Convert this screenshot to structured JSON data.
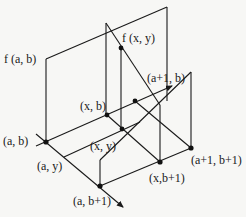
{
  "diagram": {
    "labels": {
      "f_ab": "f (a, b)",
      "f_xy": "f (x, y)",
      "a1_b": "(a+1, b)",
      "x_b": "(x, b)",
      "a_b": "(a, b)",
      "x_y": "(x, y)",
      "a_y": "(a, y)",
      "a1_b1": "(a+1, b+1)",
      "x_b1": "(x,b+1)",
      "a_b1": "(a, b+1)"
    },
    "points": [
      {
        "name": "(a, b)",
        "x": 46,
        "y": 142
      },
      {
        "name": "(x, b)",
        "x": 107,
        "y": 115
      },
      {
        "name": "(a+1, b)",
        "x": 135,
        "y": 101
      },
      {
        "name": "(x, y)",
        "x": 122,
        "y": 129
      },
      {
        "name": "(a, b+1)",
        "x": 100,
        "y": 186
      },
      {
        "name": "(x,b+1)",
        "x": 160,
        "y": 162
      },
      {
        "name": "(a+1, b+1)",
        "x": 191,
        "y": 148
      },
      {
        "name": "f (x, y)",
        "x": 121,
        "y": 48
      }
    ],
    "colors": {
      "line": "#1a1a1a",
      "background": "#f7f7f5"
    }
  }
}
